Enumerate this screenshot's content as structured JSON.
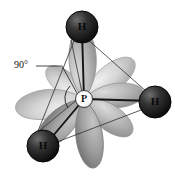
{
  "figure": {
    "background_color": "#ffffff",
    "width": 175,
    "height": 180
  },
  "annotations": {
    "angle_label": "90°",
    "angle_label_x": 15,
    "angle_label_y": 66,
    "leader_line": {
      "x1": 36,
      "y1": 66,
      "x2": 60,
      "y2": 66,
      "x3": 79,
      "y3": 97
    }
  },
  "atoms": [
    {
      "id": "p-center",
      "element": "P",
      "label": "P",
      "x": 84,
      "y": 99,
      "r": 8,
      "fill": "#fdfdfd",
      "stroke": "#2b2b2b",
      "kind": "central"
    },
    {
      "id": "h-top",
      "element": "H",
      "label": "H",
      "x": 82,
      "y": 27,
      "r": 16,
      "fill": "#1c1c1c",
      "stroke": "#0a0a0a",
      "kind": "terminal"
    },
    {
      "id": "h-right",
      "element": "H",
      "label": "H",
      "x": 155,
      "y": 102,
      "r": 16,
      "fill": "#1c1c1c",
      "stroke": "#0a0a0a",
      "kind": "terminal"
    },
    {
      "id": "h-bottom-left",
      "element": "H",
      "label": "H",
      "x": 43,
      "y": 146,
      "r": 16,
      "fill": "#1c1c1c",
      "stroke": "#0a0a0a",
      "kind": "terminal"
    }
  ],
  "bonds": [
    {
      "id": "bond-p-htop",
      "from": "P",
      "to": "H",
      "x1": 84,
      "y1": 99,
      "x2": 82,
      "y2": 32
    },
    {
      "id": "bond-p-hright",
      "from": "P",
      "to": "H",
      "x1": 84,
      "y1": 99,
      "x2": 150,
      "y2": 101
    },
    {
      "id": "bond-p-hbottomleft",
      "from": "P",
      "to": "H",
      "x1": 84,
      "y1": 99,
      "x2": 49,
      "y2": 141
    }
  ],
  "guide_lines": [
    {
      "id": "guide-htop-hright",
      "x1": 86,
      "y1": 38,
      "x2": 147,
      "y2": 92
    },
    {
      "id": "guide-htop-hbl",
      "x1": 74,
      "y1": 41,
      "x2": 38,
      "y2": 131
    },
    {
      "id": "guide-hbl-hright",
      "x1": 57,
      "y1": 142,
      "x2": 141,
      "y2": 110
    },
    {
      "id": "guide-hbl-htop-back",
      "x1": 33,
      "y1": 136,
      "x2": 79,
      "y2": 98
    }
  ],
  "orbital_lobes": [
    {
      "id": "lobe-up",
      "direction": "up",
      "angle": -92,
      "length": 62,
      "width": 30,
      "shade": "mid"
    },
    {
      "id": "lobe-upper-right",
      "direction": "upper-right",
      "angle": -38,
      "length": 58,
      "width": 28,
      "shade": "light"
    },
    {
      "id": "lobe-right",
      "direction": "right",
      "angle": -8,
      "length": 56,
      "width": 26,
      "shade": "light"
    },
    {
      "id": "lobe-lower-right",
      "direction": "lower-right",
      "angle": 38,
      "length": 52,
      "width": 26,
      "shade": "mid"
    },
    {
      "id": "lobe-down",
      "direction": "down",
      "angle": 82,
      "length": 62,
      "width": 28,
      "shade": "dark"
    },
    {
      "id": "lobe-lower-left",
      "direction": "lower-left",
      "angle": 132,
      "length": 58,
      "width": 28,
      "shade": "mid"
    },
    {
      "id": "lobe-left",
      "direction": "left",
      "angle": 172,
      "length": 62,
      "width": 30,
      "shade": "light"
    },
    {
      "id": "lobe-upper-left",
      "direction": "upper-left",
      "angle": -140,
      "length": 46,
      "width": 24,
      "shade": "light"
    }
  ],
  "colors": {
    "lobe_light": "#d6d6d6",
    "lobe_mid": "#b0b0b0",
    "lobe_dark": "#8a8a8a",
    "lobe_edge": "#9a9a9a",
    "bond": "#141414",
    "guide": "#2e2e2e",
    "atom_dark": "#1c1c1c",
    "atom_light": "#fdfdfd",
    "text": "#111111"
  }
}
